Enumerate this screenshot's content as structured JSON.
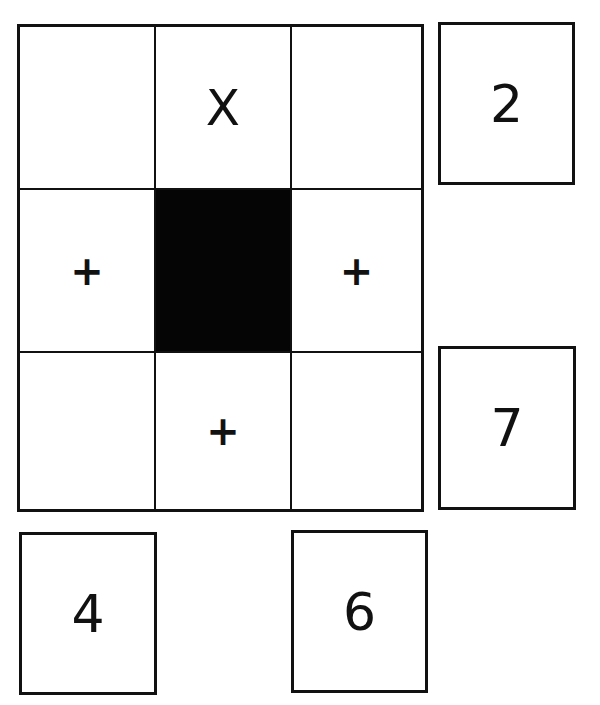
{
  "grid": {
    "rows": 3,
    "cols": 3,
    "cells": [
      {
        "row": 1,
        "col": 1,
        "symbol": "",
        "filled": false
      },
      {
        "row": 1,
        "col": 2,
        "symbol": "X",
        "filled": false
      },
      {
        "row": 1,
        "col": 3,
        "symbol": "",
        "filled": false
      },
      {
        "row": 2,
        "col": 1,
        "symbol": "+",
        "filled": false
      },
      {
        "row": 2,
        "col": 2,
        "symbol": "",
        "filled": true
      },
      {
        "row": 2,
        "col": 3,
        "symbol": "+",
        "filled": false
      },
      {
        "row": 3,
        "col": 1,
        "symbol": "",
        "filled": false
      },
      {
        "row": 3,
        "col": 2,
        "symbol": "+",
        "filled": false
      },
      {
        "row": 3,
        "col": 3,
        "symbol": "",
        "filled": false
      }
    ]
  },
  "side_boxes": {
    "right_top": "2",
    "right_bottom": "7",
    "bottom_left": "4",
    "bottom_right": "6"
  },
  "colors": {
    "line": "#111111",
    "filled": "#050505",
    "background": "#ffffff"
  }
}
